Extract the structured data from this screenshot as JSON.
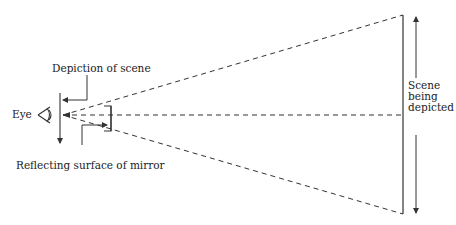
{
  "diagram": {
    "labels": {
      "eye": "Eye",
      "depiction": "Depiction of scene",
      "mirror": "Reflecting surface of mirror",
      "scene_line1": "Scene",
      "scene_line2": "being",
      "scene_line3": "depicted"
    },
    "colors": {
      "stroke": "#333333",
      "background": "#ffffff"
    }
  }
}
